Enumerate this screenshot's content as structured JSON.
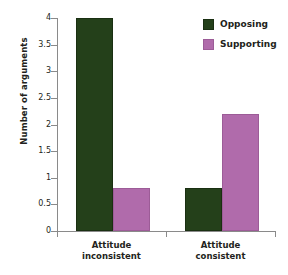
{
  "chart_data": {
    "type": "bar",
    "title": "",
    "xlabel": "",
    "ylabel": "Number of arguments",
    "categories": [
      "Attitude inconsistent",
      "Attitude consistent"
    ],
    "category_lines": [
      [
        "Attitude",
        "inconsistent"
      ],
      [
        "Attitude",
        "consistent"
      ]
    ],
    "series": [
      {
        "name": "Opposing",
        "color": "#24401a",
        "values": [
          4.0,
          0.8
        ]
      },
      {
        "name": "Supporting",
        "color": "#b06bab",
        "values": [
          0.8,
          2.2
        ]
      }
    ],
    "ylim": [
      0,
      4
    ],
    "ytick_values": [
      0,
      0.5,
      1,
      1.5,
      2,
      2.5,
      3,
      3.5,
      4
    ],
    "ytick_labels": [
      "0",
      "0.5",
      "1",
      "1.5",
      "2",
      "2.5",
      "3",
      "3.5",
      "4"
    ],
    "grid": false,
    "legend_position": "top-right"
  },
  "legend": {
    "entries": [
      {
        "label": "Opposing"
      },
      {
        "label": "Supporting"
      }
    ]
  },
  "axes": {
    "y_title": "Number of arguments"
  }
}
